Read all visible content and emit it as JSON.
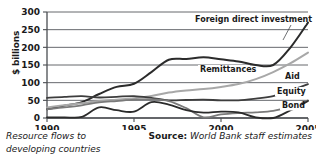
{
  "caption": {
    "line1": "Resource flows to",
    "line2": "developing countries"
  },
  "source": {
    "label": "Source:",
    "value": "World Bank staff estimates"
  },
  "colors": {
    "fdi": "#2b2b2b",
    "remittances": "#a8a8a8",
    "aid": "#3d3d3d",
    "equity": "#7a7a7a",
    "bond": "#2b2b2b",
    "grid": "#55585c",
    "axis": "#4a4d51",
    "background": "#ffffff",
    "text": "#1a1a1a"
  },
  "chart_data": {
    "type": "line",
    "title": "",
    "subtitle": "",
    "xlabel": "",
    "ylabel": "$ billions",
    "xlim": [
      1990,
      2005
    ],
    "ylim": [
      0,
      300
    ],
    "ytick_values": [
      0,
      50,
      100,
      150,
      200,
      250,
      300
    ],
    "ytick_labels": [
      "0",
      "50",
      "100",
      "150",
      "200",
      "250",
      "300"
    ],
    "xtick_values": [
      1990,
      1995,
      2000,
      2005
    ],
    "xtick_labels": [
      "1990",
      "1995",
      "2000",
      "2005"
    ],
    "grid": "horizontal",
    "legend": "inline-labels",
    "x": [
      1990,
      1991,
      1992,
      1993,
      1994,
      1995,
      1996,
      1997,
      1998,
      1999,
      2000,
      2001,
      2002,
      2003,
      2004,
      2005
    ],
    "series": [
      {
        "name": "Foreign direct investment",
        "label": "Foreign direct investment",
        "color": "#2b2b2b",
        "width": 2.0,
        "values": [
          25,
          35,
          45,
          68,
          88,
          97,
          130,
          165,
          167,
          172,
          166,
          160,
          150,
          150,
          200,
          270
        ]
      },
      {
        "name": "Remittances",
        "label": "Remittances",
        "color": "#a8a8a8",
        "width": 2.0,
        "values": [
          30,
          36,
          42,
          48,
          52,
          56,
          62,
          72,
          78,
          82,
          88,
          96,
          110,
          130,
          155,
          185
        ]
      },
      {
        "name": "Aid",
        "label": "Aid",
        "color": "#3d3d3d",
        "width": 1.8,
        "values": [
          57,
          60,
          62,
          58,
          60,
          62,
          57,
          50,
          51,
          52,
          50,
          50,
          55,
          62,
          78,
          96
        ]
      },
      {
        "name": "Equity",
        "label": "Equity",
        "color": "#7a7a7a",
        "width": 1.8,
        "values": [
          25,
          30,
          36,
          44,
          48,
          52,
          53,
          48,
          28,
          2,
          10,
          14,
          16,
          20,
          32,
          50
        ]
      },
      {
        "name": "Bond",
        "label": "Bond",
        "color": "#2b2b2b",
        "width": 1.8,
        "values": [
          2,
          2,
          3,
          30,
          22,
          18,
          45,
          38,
          22,
          15,
          18,
          16,
          2,
          0,
          22,
          48
        ]
      }
    ]
  }
}
